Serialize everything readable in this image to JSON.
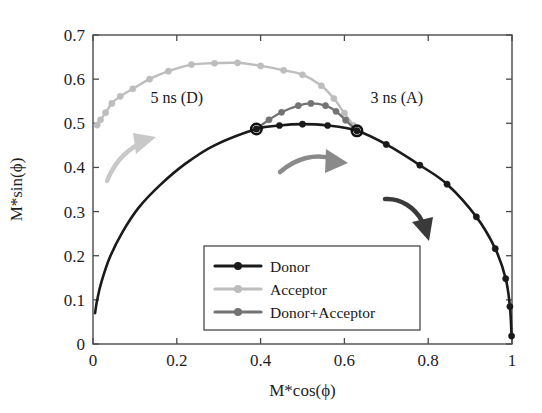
{
  "chart_data": {
    "type": "line",
    "title": "",
    "xlabel": "M*cos(ϕ)",
    "ylabel": "M*sin(ϕ)",
    "xlim": [
      0,
      1
    ],
    "ylim": [
      0,
      0.7
    ],
    "xticks": [
      "0",
      "0.2",
      "0.4",
      "0.6",
      "0.8",
      "1"
    ],
    "xtick_values": [
      0,
      0.2,
      0.4,
      0.6,
      0.8,
      1
    ],
    "yticks": [
      "0",
      "0.1",
      "0.2",
      "0.3",
      "0.4",
      "0.5",
      "0.6",
      "0.7"
    ],
    "ytick_values": [
      0,
      0.1,
      0.2,
      0.3,
      0.4,
      0.5,
      0.6,
      0.7
    ],
    "grid": false,
    "legend_position": "lower-center",
    "series": [
      {
        "name": "Donor",
        "color": "#1a1a1a",
        "marker": "circle",
        "points": [
          [
            0.005,
            0.07
          ],
          [
            0.01,
            0.1
          ],
          [
            0.02,
            0.14
          ],
          [
            0.04,
            0.196
          ],
          [
            0.07,
            0.253
          ],
          [
            0.11,
            0.31
          ],
          [
            0.16,
            0.36
          ],
          [
            0.22,
            0.408
          ],
          [
            0.29,
            0.45
          ],
          [
            0.39,
            0.487
          ],
          [
            0.445,
            0.495
          ],
          [
            0.5,
            0.498
          ],
          [
            0.56,
            0.495
          ],
          [
            0.63,
            0.483
          ],
          [
            0.7,
            0.452
          ],
          [
            0.78,
            0.405
          ],
          [
            0.845,
            0.362
          ],
          [
            0.915,
            0.288
          ],
          [
            0.96,
            0.216
          ],
          [
            0.985,
            0.148
          ],
          [
            0.995,
            0.085
          ],
          [
            0.999,
            0.018
          ]
        ]
      },
      {
        "name": "Acceptor",
        "color": "#bdbdbd",
        "marker": "circle",
        "points": [
          [
            0.01,
            0.496
          ],
          [
            0.018,
            0.508
          ],
          [
            0.03,
            0.524
          ],
          [
            0.045,
            0.545
          ],
          [
            0.065,
            0.561
          ],
          [
            0.095,
            0.578
          ],
          [
            0.135,
            0.6
          ],
          [
            0.18,
            0.618
          ],
          [
            0.235,
            0.633
          ],
          [
            0.29,
            0.636
          ],
          [
            0.345,
            0.637
          ],
          [
            0.4,
            0.63
          ],
          [
            0.455,
            0.62
          ],
          [
            0.5,
            0.61
          ],
          [
            0.545,
            0.585
          ],
          [
            0.575,
            0.556
          ],
          [
            0.6,
            0.523
          ],
          [
            0.622,
            0.495
          ]
        ]
      },
      {
        "name": "Donor+Acceptor",
        "color": "#737373",
        "marker": "circle",
        "points": [
          [
            0.39,
            0.487
          ],
          [
            0.42,
            0.508
          ],
          [
            0.45,
            0.525
          ],
          [
            0.49,
            0.54
          ],
          [
            0.52,
            0.545
          ],
          [
            0.555,
            0.54
          ],
          [
            0.58,
            0.527
          ],
          [
            0.603,
            0.507
          ],
          [
            0.63,
            0.483
          ]
        ]
      }
    ],
    "annotations": [
      {
        "name": "donor-lifetime-label",
        "text": "5 ns (D)",
        "x": 0.2,
        "y": 0.545
      },
      {
        "name": "acceptor-lifetime-label",
        "text": "3 ns (A)",
        "x": 0.725,
        "y": 0.545
      }
    ],
    "arrows": [
      {
        "name": "acceptor-direction-arrow",
        "color": "#c8c8c8"
      },
      {
        "name": "donor-acceptor-direction-arrow",
        "color": "#8a8a8a"
      },
      {
        "name": "donor-direction-arrow",
        "color": "#3a3a3a"
      }
    ],
    "crossing_points": [
      {
        "x": 0.39,
        "y": 0.487
      },
      {
        "x": 0.63,
        "y": 0.483
      }
    ]
  },
  "legend": {
    "entries": [
      {
        "label": "Donor",
        "color": "#1a1a1a"
      },
      {
        "label": "Acceptor",
        "color": "#bdbdbd"
      },
      {
        "label": "Donor+Acceptor",
        "color": "#737373"
      }
    ]
  }
}
